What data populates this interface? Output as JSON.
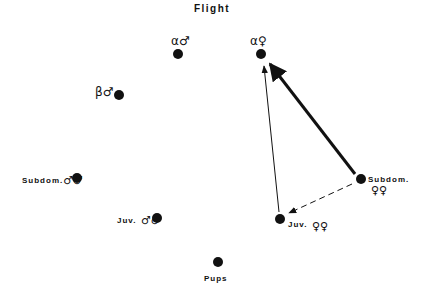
{
  "title": "Flight",
  "nodes": {
    "alpha_male": {
      "label": "α♂"
    },
    "alpha_female": {
      "label": "α♀"
    },
    "beta_male": {
      "label": "β♂"
    },
    "subdom_males": {
      "text": "Subdom.",
      "symbol": "♂♂"
    },
    "juv_males": {
      "text": "Juv.",
      "symbol": "♂♂"
    },
    "pups": {
      "text": "Pups"
    },
    "juv_females": {
      "text": "Juv.",
      "symbol": "♀♀"
    },
    "subdom_females": {
      "text": "Subdom.",
      "symbol": "♀♀"
    }
  },
  "edges": [
    {
      "from": "subdom_females",
      "to": "alpha_female",
      "style": "thick"
    },
    {
      "from": "juv_females",
      "to": "alpha_female",
      "style": "thin"
    },
    {
      "from": "subdom_females",
      "to": "juv_females",
      "style": "dashed"
    }
  ],
  "colors": {
    "ink": "#111111",
    "background": "#ffffff"
  }
}
